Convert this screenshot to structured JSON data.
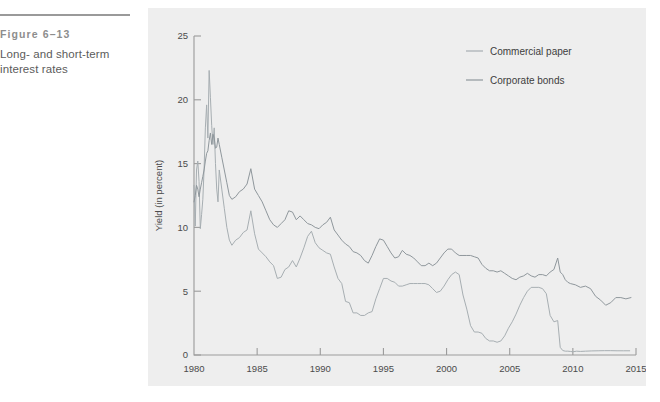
{
  "caption": {
    "figure_number": "Figure 6–13",
    "title": "Long- and short-term interest rates"
  },
  "colors": {
    "panel_background": "#eeeeee",
    "page_background": "#ffffff",
    "axis": "#9b9b9b",
    "rule": "#9a9a9a",
    "commercial_paper": "#a7aeb2",
    "corporate_bonds": "#8f979c",
    "caption_number": "#8d8d8d",
    "caption_title": "#5c5c5c",
    "tick_text": "#4b4b4b"
  },
  "chart_data": {
    "type": "line",
    "title": "",
    "xlabel": "",
    "ylabel": "Yield (in percent)",
    "xlim": [
      1980,
      2015
    ],
    "ylim": [
      0,
      25
    ],
    "xticks": [
      "1980",
      "1985",
      "1990",
      "1995",
      "2000",
      "2005",
      "2010",
      "2015"
    ],
    "xtick_values": [
      1980,
      1985,
      1990,
      1995,
      2000,
      2005,
      2010,
      2015
    ],
    "yticks": [
      "0",
      "5",
      "10",
      "15",
      "20",
      "25"
    ],
    "ytick_values": [
      0,
      5,
      10,
      15,
      20,
      25
    ],
    "grid": false,
    "legend_position": "top-right",
    "series": [
      {
        "name": "Commercial paper",
        "color": "#a7aeb2",
        "x": [
          1980.0,
          1980.1,
          1980.2,
          1980.3,
          1980.4,
          1980.5,
          1980.6,
          1980.7,
          1980.8,
          1980.9,
          1981.0,
          1981.1,
          1981.2,
          1981.3,
          1981.4,
          1981.5,
          1981.6,
          1981.7,
          1981.8,
          1981.9,
          1982.0,
          1982.2,
          1982.4,
          1982.6,
          1982.8,
          1983.0,
          1983.3,
          1983.6,
          1983.9,
          1984.2,
          1984.5,
          1984.8,
          1985.1,
          1985.4,
          1985.7,
          1986.0,
          1986.3,
          1986.6,
          1986.9,
          1987.2,
          1987.5,
          1987.8,
          1988.1,
          1988.4,
          1988.7,
          1989.0,
          1989.3,
          1989.6,
          1989.9,
          1990.2,
          1990.5,
          1990.8,
          1991.1,
          1991.4,
          1991.7,
          1992.0,
          1992.3,
          1992.6,
          1992.9,
          1993.2,
          1993.5,
          1993.8,
          1994.1,
          1994.4,
          1994.7,
          1995.0,
          1995.3,
          1995.6,
          1995.9,
          1996.2,
          1996.5,
          1996.8,
          1997.1,
          1997.4,
          1997.7,
          1998.0,
          1998.3,
          1998.6,
          1998.9,
          1999.2,
          1999.5,
          1999.8,
          2000.1,
          2000.4,
          2000.7,
          2001.0,
          2001.3,
          2001.6,
          2001.9,
          2002.2,
          2002.5,
          2002.8,
          2003.1,
          2003.4,
          2003.7,
          2004.0,
          2004.3,
          2004.6,
          2004.9,
          2005.2,
          2005.5,
          2005.8,
          2006.1,
          2006.4,
          2006.7,
          2007.0,
          2007.3,
          2007.6,
          2007.9,
          2008.2,
          2008.5,
          2008.8,
          2009.0,
          2009.2,
          2009.4,
          2009.6,
          2009.8,
          2010.0,
          2010.3,
          2010.6,
          2011.0,
          2011.5,
          2012.0,
          2012.5,
          2013.0,
          2013.5,
          2014.0,
          2014.5
        ],
        "y": [
          13.3,
          10.1,
          14.5,
          15.2,
          13.6,
          9.9,
          11.0,
          12.2,
          14.6,
          17.8,
          19.6,
          17.0,
          22.3,
          20.2,
          18.0,
          16.5,
          17.8,
          15.0,
          13.0,
          12.0,
          14.5,
          13.0,
          11.5,
          10.0,
          9.0,
          8.6,
          9.0,
          9.2,
          9.6,
          9.8,
          11.3,
          9.5,
          8.3,
          8.0,
          7.7,
          7.3,
          7.0,
          6.0,
          6.1,
          6.7,
          6.9,
          7.4,
          6.9,
          7.6,
          8.4,
          9.3,
          9.7,
          8.8,
          8.4,
          8.2,
          8.0,
          7.9,
          6.9,
          6.0,
          5.6,
          4.2,
          4.1,
          3.3,
          3.3,
          3.1,
          3.1,
          3.3,
          3.4,
          4.4,
          5.2,
          6.0,
          6.0,
          5.8,
          5.7,
          5.4,
          5.4,
          5.5,
          5.6,
          5.6,
          5.6,
          5.6,
          5.6,
          5.5,
          5.2,
          4.9,
          5.0,
          5.4,
          5.9,
          6.3,
          6.5,
          6.3,
          4.7,
          3.6,
          2.3,
          1.8,
          1.8,
          1.7,
          1.3,
          1.1,
          1.1,
          1.0,
          1.1,
          1.5,
          2.1,
          2.6,
          3.2,
          3.9,
          4.5,
          5.0,
          5.3,
          5.3,
          5.3,
          5.2,
          4.8,
          3.1,
          2.6,
          2.7,
          0.6,
          0.35,
          0.3,
          0.3,
          0.28,
          0.25,
          0.3,
          0.28,
          0.3,
          0.32,
          0.33,
          0.34,
          0.34,
          0.33,
          0.33,
          0.33
        ]
      },
      {
        "name": "Corporate bonds",
        "color": "#8f979c",
        "x": [
          1980.0,
          1980.1,
          1980.2,
          1980.3,
          1980.4,
          1980.5,
          1980.6,
          1980.7,
          1980.8,
          1980.9,
          1981.0,
          1981.1,
          1981.2,
          1981.3,
          1981.4,
          1981.5,
          1981.6,
          1981.7,
          1981.8,
          1981.9,
          1982.0,
          1982.2,
          1982.4,
          1982.6,
          1982.8,
          1983.0,
          1983.3,
          1983.6,
          1983.9,
          1984.2,
          1984.5,
          1984.8,
          1985.1,
          1985.4,
          1985.7,
          1986.0,
          1986.3,
          1986.6,
          1986.9,
          1987.2,
          1987.5,
          1987.8,
          1988.1,
          1988.4,
          1988.7,
          1989.0,
          1989.3,
          1989.6,
          1989.9,
          1990.2,
          1990.5,
          1990.8,
          1991.1,
          1991.4,
          1991.7,
          1992.0,
          1992.3,
          1992.6,
          1992.9,
          1993.2,
          1993.5,
          1993.8,
          1994.1,
          1994.4,
          1994.7,
          1995.0,
          1995.3,
          1995.6,
          1995.9,
          1996.2,
          1996.5,
          1996.8,
          1997.1,
          1997.4,
          1997.7,
          1998.0,
          1998.3,
          1998.6,
          1998.9,
          1999.2,
          1999.5,
          1999.8,
          2000.1,
          2000.4,
          2000.7,
          2001.0,
          2001.3,
          2001.6,
          2001.9,
          2002.2,
          2002.5,
          2002.8,
          2003.1,
          2003.4,
          2003.7,
          2004.0,
          2004.3,
          2004.6,
          2004.9,
          2005.2,
          2005.5,
          2005.8,
          2006.1,
          2006.4,
          2006.7,
          2007.0,
          2007.3,
          2007.6,
          2007.9,
          2008.2,
          2008.5,
          2008.8,
          2009.0,
          2009.2,
          2009.4,
          2009.6,
          2009.8,
          2010.2,
          2010.6,
          2011.0,
          2011.4,
          2011.8,
          2012.2,
          2012.6,
          2013.0,
          2013.4,
          2013.8,
          2014.2,
          2014.6
        ],
        "y": [
          12.0,
          12.5,
          13.3,
          13.0,
          12.4,
          13.0,
          13.5,
          14.0,
          14.5,
          15.2,
          15.8,
          16.0,
          16.8,
          17.4,
          16.5,
          17.3,
          17.0,
          16.2,
          16.3,
          17.0,
          16.5,
          15.5,
          14.5,
          13.5,
          12.5,
          12.2,
          12.4,
          12.8,
          13.0,
          13.4,
          14.6,
          13.0,
          12.5,
          12.0,
          11.3,
          10.6,
          10.2,
          10.0,
          10.3,
          10.6,
          11.3,
          11.2,
          10.6,
          10.9,
          10.6,
          10.3,
          10.2,
          10.0,
          9.9,
          10.2,
          10.4,
          10.8,
          9.8,
          9.4,
          9.0,
          8.7,
          8.5,
          8.1,
          8.0,
          7.8,
          7.4,
          7.2,
          7.8,
          8.5,
          9.1,
          9.0,
          8.5,
          8.0,
          7.6,
          7.7,
          8.2,
          7.9,
          7.8,
          7.6,
          7.3,
          7.0,
          7.0,
          7.2,
          7.0,
          7.2,
          7.6,
          8.0,
          8.3,
          8.3,
          8.0,
          7.8,
          7.8,
          7.8,
          7.8,
          7.7,
          7.6,
          7.1,
          6.8,
          6.6,
          6.6,
          6.5,
          6.6,
          6.4,
          6.2,
          6.0,
          5.9,
          6.1,
          6.2,
          6.4,
          6.2,
          6.1,
          6.3,
          6.3,
          6.2,
          6.5,
          6.7,
          7.6,
          6.5,
          6.3,
          5.9,
          5.7,
          5.6,
          5.5,
          5.3,
          5.4,
          5.2,
          4.6,
          4.3,
          3.9,
          4.1,
          4.5,
          4.5,
          4.4,
          4.5
        ]
      }
    ]
  }
}
